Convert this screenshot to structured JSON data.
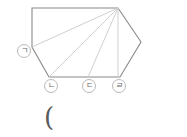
{
  "figure": {
    "title": "",
    "type": "geometry-polygon-diagram",
    "colors": {
      "outline": "#8a8a8a",
      "inner_lines": "#cfcfcf",
      "label_border": "#b9b9b9",
      "label_text": "#6b6b6b",
      "background": "#ffffff"
    },
    "polygon": {
      "name": "hexagon",
      "vertices": [
        {
          "id": "top-left",
          "x": 32,
          "y": 8,
          "label": ""
        },
        {
          "id": "top-right",
          "x": 118,
          "y": 8,
          "label": ""
        },
        {
          "id": "right",
          "x": 141,
          "y": 42,
          "label": ""
        },
        {
          "id": "bottom-right",
          "x": 120,
          "y": 77,
          "label": "ㄹ"
        },
        {
          "id": "bottom-left",
          "x": 49,
          "y": 77,
          "label": "ㄴ"
        },
        {
          "id": "left",
          "x": 32,
          "y": 47,
          "label": "ㄱ"
        }
      ]
    },
    "inner_lines": [
      {
        "id": "diagonal-to-left",
        "from": "top-right",
        "to": "left",
        "x1": 118,
        "y1": 8,
        "x2": 32,
        "y2": 47
      },
      {
        "id": "diagonal-to-bottom-left",
        "from": "top-right",
        "to": "bottom-left",
        "x1": 118,
        "y1": 8,
        "x2": 49,
        "y2": 77
      },
      {
        "id": "diagonal-to-bottom-mid",
        "from": "top-right",
        "to": "bottom-mid",
        "x1": 118,
        "y1": 8,
        "x2": 88,
        "y2": 77
      },
      {
        "id": "vertical-to-bottom-right",
        "from": "top-right",
        "to": "bottom-right",
        "x1": 118,
        "y1": 8,
        "x2": 118,
        "y2": 77
      }
    ],
    "labels": [
      {
        "id": "label-g",
        "text": "ㄱ",
        "left": 17,
        "top": 44
      },
      {
        "id": "label-n",
        "text": "ㄴ",
        "left": 44,
        "top": 79
      },
      {
        "id": "label-d",
        "text": "ㄷ",
        "left": 82,
        "top": 79
      },
      {
        "id": "label-r",
        "text": "ㄹ",
        "left": 112,
        "top": 79
      }
    ],
    "caption": {
      "text": "("
    }
  }
}
